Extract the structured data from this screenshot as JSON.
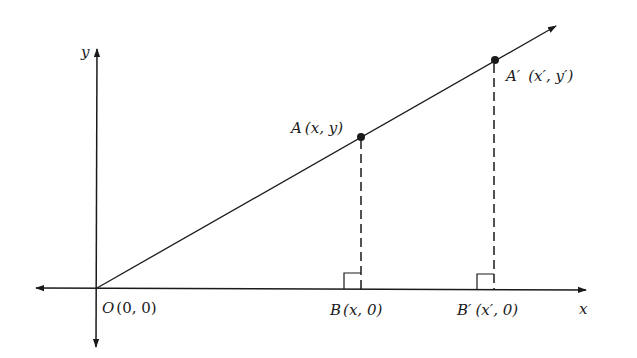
{
  "diagram": {
    "axes": {
      "x_label": "x",
      "y_label": "y"
    },
    "points": {
      "origin": {
        "name": "O",
        "coords": "(0, 0)"
      },
      "A": {
        "name": "A",
        "coords": "(x, y)"
      },
      "A_prime": {
        "name": "A′",
        "coords": "(x′, y′)"
      },
      "B": {
        "name": "B",
        "coords": "(x, 0)"
      },
      "B_prime": {
        "name": "B′",
        "coords": "(x′, 0)"
      }
    },
    "colors": {
      "ink": "#1a1a1a",
      "background": "#ffffff"
    }
  }
}
